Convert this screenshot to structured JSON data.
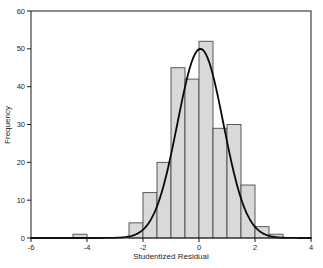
{
  "chart_data": {
    "type": "bar",
    "subtype": "histogram-with-normal-curve",
    "title": "",
    "xlabel": "Studentized Residual",
    "ylabel": "Frequency",
    "xlim": [
      -6,
      4
    ],
    "ylim": [
      0,
      60
    ],
    "x_ticks": [
      -6,
      -4,
      -2,
      0,
      2,
      4
    ],
    "y_ticks": [
      0,
      10,
      20,
      30,
      40,
      50,
      60
    ],
    "bin_width": 0.5,
    "bins": [
      {
        "x": -4.5,
        "h": 1
      },
      {
        "x": -2.5,
        "h": 4
      },
      {
        "x": -2.0,
        "h": 12
      },
      {
        "x": -1.5,
        "h": 20
      },
      {
        "x": -1.0,
        "h": 45
      },
      {
        "x": -0.5,
        "h": 42
      },
      {
        "x": 0.0,
        "h": 52
      },
      {
        "x": 0.5,
        "h": 29
      },
      {
        "x": 1.0,
        "h": 30
      },
      {
        "x": 1.5,
        "h": 14
      },
      {
        "x": 2.0,
        "h": 3
      },
      {
        "x": 2.5,
        "h": 1
      }
    ],
    "normal_curve": {
      "mean": 0.05,
      "sd": 0.82,
      "peak": 50
    },
    "legend": null,
    "grid": false,
    "colors": {
      "background": "#ffffff",
      "bar_fill": "#d9d9d9",
      "bar_edge": "#4a4a4a",
      "curve": "#0a0a0a",
      "frame": "#1a1a1a",
      "text": "#262626"
    }
  }
}
